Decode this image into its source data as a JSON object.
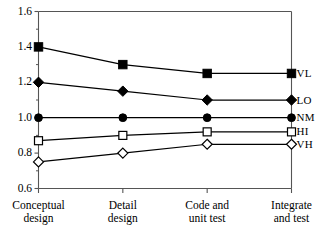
{
  "chart_data": {
    "type": "line",
    "title": "",
    "xlabel": "",
    "ylabel": "",
    "categories": [
      "Conceptual design",
      "Detail design",
      "Code and unit test",
      "Integrate and test"
    ],
    "category_lines": [
      [
        "Conceptual",
        "design"
      ],
      [
        "Detail",
        "design"
      ],
      [
        "Code and",
        "unit test"
      ],
      [
        "Integrate",
        "and test"
      ]
    ],
    "ylim": [
      0.6,
      1.6
    ],
    "ytick_values": [
      1.6,
      1.4,
      1.2,
      1.0,
      0.8,
      0.6
    ],
    "ytick_labels": [
      "1.6",
      "1.4",
      "1.2",
      "1.0",
      "0.8",
      "0.6"
    ],
    "yminor_step": 0.1,
    "grid": false,
    "legend_position": "right-of-axis",
    "series": [
      {
        "name": "VL",
        "label": "VL",
        "marker": "filled-square",
        "values": [
          1.4,
          1.3,
          1.25,
          1.25
        ]
      },
      {
        "name": "LO",
        "label": "LO",
        "marker": "filled-diamond",
        "values": [
          1.2,
          1.15,
          1.1,
          1.1
        ]
      },
      {
        "name": "NM",
        "label": "NM",
        "marker": "filled-circle",
        "values": [
          1.0,
          1.0,
          1.0,
          1.0
        ]
      },
      {
        "name": "HI",
        "label": "HI",
        "marker": "open-square",
        "values": [
          0.87,
          0.9,
          0.92,
          0.92
        ]
      },
      {
        "name": "VH",
        "label": "VH",
        "marker": "open-diamond",
        "values": [
          0.75,
          0.8,
          0.85,
          0.85
        ]
      }
    ],
    "line_color": "#000000",
    "axis_color": "#555555"
  }
}
